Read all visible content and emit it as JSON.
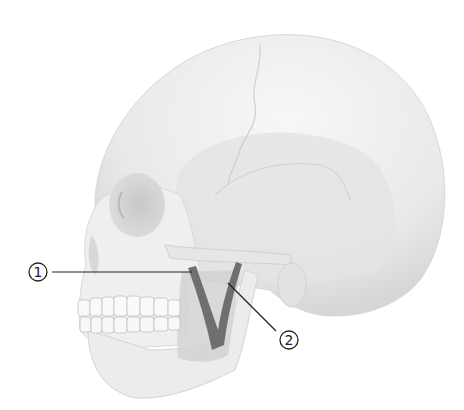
{
  "figure": {
    "colors": {
      "bone": "#eeeeee",
      "bone_light": "#f6f6f6",
      "bone_shadow": "#d4d4d4",
      "bone_dark": "#bdbdbd",
      "highlight_region": "#c9c9c9",
      "highlight_structure": "#6f6f6f",
      "leader_line": "#222222",
      "background": "#ffffff"
    },
    "callouts": [
      {
        "id": 1,
        "label": "1",
        "x": 38,
        "y": 276
      },
      {
        "id": 2,
        "label": "2",
        "x": 289,
        "y": 340
      }
    ]
  }
}
